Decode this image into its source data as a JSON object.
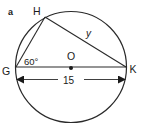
{
  "figure": {
    "part_label": "a",
    "points": {
      "G": {
        "label": "G",
        "x": 16,
        "y": 67
      },
      "H": {
        "label": "H",
        "x": 45,
        "y": 17
      },
      "K": {
        "label": "K",
        "x": 126,
        "y": 67
      },
      "O": {
        "label": "O",
        "x": 71,
        "y": 67
      }
    },
    "circle": {
      "cx": 71,
      "cy": 67,
      "r": 55.5
    },
    "angle_label": "60°",
    "side_label": "y",
    "diameter_length": "15",
    "colors": {
      "stroke": "#2a2a2a",
      "text": "#1a1a1a",
      "background": "#ffffff"
    }
  }
}
